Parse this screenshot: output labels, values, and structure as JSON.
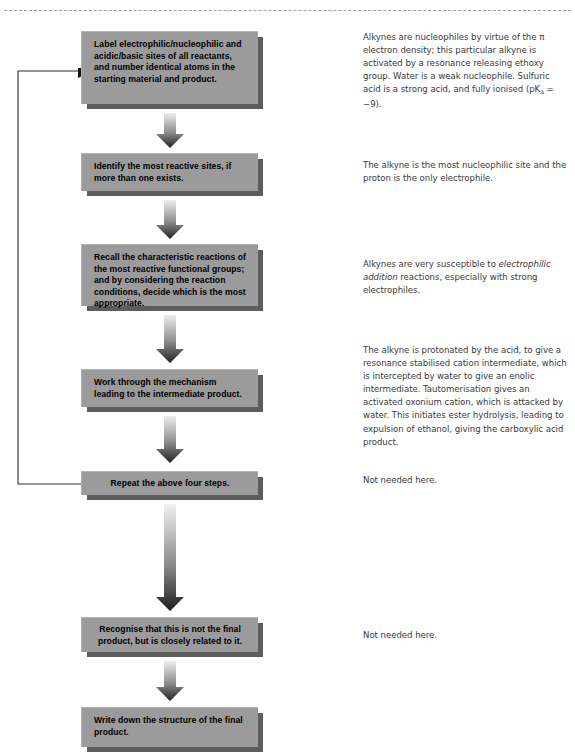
{
  "header": {
    "left_text": "",
    "right_text": ""
  },
  "flow": {
    "steps": [
      {
        "id": "label-sites",
        "text": "Label electrophilic/nucleophilic and acidic/basic sites of all reactants, and number identical atoms in the starting material and product.",
        "align": "left"
      },
      {
        "id": "identify-reactive-sites",
        "text": "Identify the most reactive sites, if more than one exists.",
        "align": "left"
      },
      {
        "id": "recall-characteristic-reactions",
        "text": "Recall the characteristic reactions of the most reactive functional groups; and by considering the reaction conditions, decide which is the most appropriate.",
        "align": "left"
      },
      {
        "id": "work-through-mechanism",
        "text": "Work through the mechanism leading to the intermediate product.",
        "align": "left"
      },
      {
        "id": "repeat-four-steps",
        "text": "Repeat the above four steps.",
        "align": "center"
      },
      {
        "id": "recognise-not-final",
        "text": "Recognise that this is not the final product, but is closely related to it.",
        "align": "center"
      },
      {
        "id": "write-final-structure",
        "text": "Write down the structure of the final product.",
        "align": "left"
      }
    ]
  },
  "notes": {
    "note1_part1": "Alkynes are nucleophiles by virtue of the ",
    "note1_pi": "π",
    "note1_part2": " electron density; this particular alkyne is activated by a resonance releasing ethoxy group. Water is a weak nucleophile. Sulfuric acid is a strong acid, and fully ionised (pK",
    "note1_sub": "a",
    "note1_part3": " = −9).",
    "note2": "The alkyne is the most nucleophilic site and the proton is the only electrophile.",
    "note3_part1": "Alkynes are very susceptible to ",
    "note3_italic": "electrophilic addition",
    "note3_part2": " reactions, especially with strong electrophiles.",
    "note4": "The alkyne is protonated by the acid, to give a resonance stabilised cation intermediate, which is intercepted by water to give an enolic intermediate. Tautomerisation gives an activated oxonium cation, which is attacked by water. This initiates ester hydrolysis, leading to expulsion of ethanol, giving the carboxylic acid product.",
    "note5": "Not needed here.",
    "note6": "Not needed here."
  },
  "colors": {
    "box_fill": "#9b9b9b",
    "box_shadow": "#5d5d5d",
    "arrow_top": "#e8e8e8",
    "arrow_bottom": "#2a2a2a",
    "note_text": "#3b3b3b",
    "rule": "#9d9d9d"
  }
}
